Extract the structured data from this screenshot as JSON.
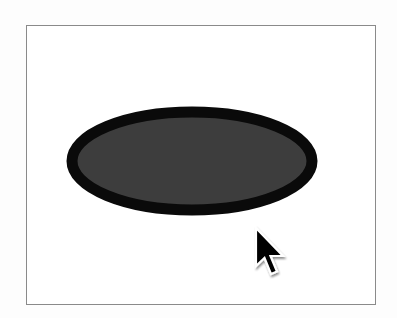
{
  "canvas": {
    "background": "#ffffff",
    "border_color": "#8a8a8a"
  },
  "shapes": [
    {
      "type": "ellipse",
      "cx": 192,
      "cy": 161,
      "rx": 120,
      "ry": 49,
      "fill": "#3d3d3d",
      "stroke": "#0a0a0a",
      "stroke_width": 11
    }
  ],
  "cursor": {
    "icon": "arrow-pointer-icon",
    "x": 256,
    "y": 228,
    "fill": "#000000",
    "outline": "#ffffff"
  }
}
